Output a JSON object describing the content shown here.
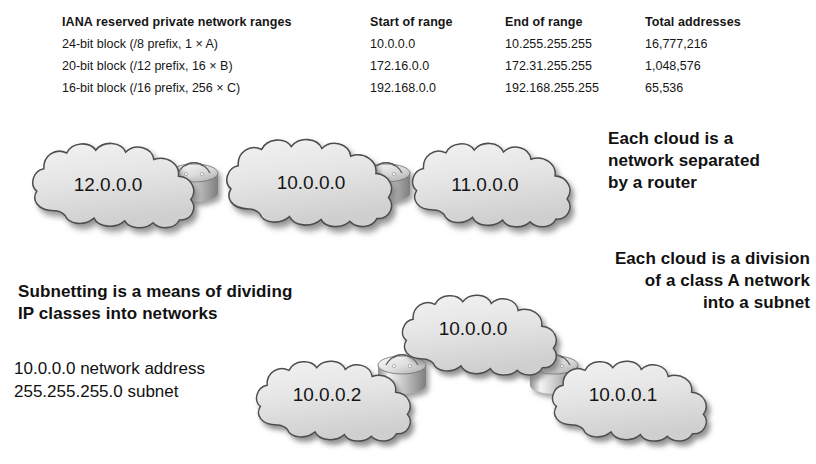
{
  "table": {
    "headers": [
      "IANA reserved private network ranges",
      "Start of range",
      "End of range",
      "Total addresses"
    ],
    "rows": [
      {
        "block": "24-bit block (/8 prefix, 1 × A)",
        "start": "10.0.0.0",
        "end": "10.255.255.255",
        "total": "16,777,216"
      },
      {
        "block": "20-bit block (/12 prefix, 16 × B)",
        "start": "172.16.0.0",
        "end": "172.31.255.255",
        "total": "1,048,576"
      },
      {
        "block": "16-bit block (/16 prefix, 256 × C)",
        "start": "192.168.0.0",
        "end": "192.168.255.255",
        "total": "65,536"
      }
    ]
  },
  "callouts": {
    "router_note": "Each cloud is a\nnetwork separated\nby a router",
    "subnet_note": "Each cloud is a division\nof a class A network\ninto a subnet",
    "subnetting_note": "Subnetting is a means of dividing\nIP classes into networks",
    "address_note": "10.0.0.0 network address\n255.255.255.0 subnet"
  },
  "diagram": {
    "top_row": {
      "clouds": [
        {
          "label": "12.0.0.0"
        },
        {
          "label": "10.0.0.0"
        },
        {
          "label": "11.0.0.0"
        }
      ],
      "routers": 2
    },
    "bottom_row": {
      "clouds": [
        {
          "label": "10.0.0.0"
        },
        {
          "label": "10.0.0.2"
        },
        {
          "label": "10.0.0.1"
        }
      ],
      "routers": 2
    },
    "colors": {
      "cloud_fill_light": "#ececec",
      "cloud_fill_dark": "#d2d2d2",
      "cloud_stroke": "#4a4a4a",
      "router_body_light": "#f2f2f2",
      "router_body_dark": "#9a9a9a",
      "shadow": "#9b9b9b"
    }
  }
}
